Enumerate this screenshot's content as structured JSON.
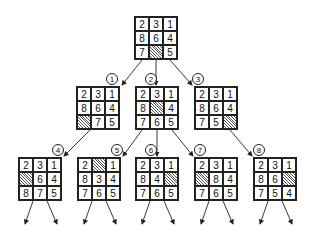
{
  "diagram": {
    "type": "8-puzzle-search-tree",
    "colors": {
      "line": "#222222",
      "blank_hatch": "#555555"
    },
    "root": {
      "tiles": [
        "2",
        "3",
        "1",
        "8",
        "6",
        "4",
        "7",
        "",
        "5"
      ]
    },
    "nodes": [
      {
        "label": "1",
        "tiles": [
          "2",
          "3",
          "1",
          "8",
          "6",
          "4",
          "",
          "7",
          "5"
        ]
      },
      {
        "label": "2",
        "tiles": [
          "2",
          "3",
          "1",
          "8",
          "",
          "4",
          "7",
          "6",
          "5"
        ]
      },
      {
        "label": "3",
        "tiles": [
          "2",
          "3",
          "1",
          "8",
          "6",
          "4",
          "7",
          "5",
          ""
        ]
      },
      {
        "label": "4",
        "tiles": [
          "2",
          "3",
          "1",
          "",
          "6",
          "4",
          "8",
          "7",
          "5"
        ]
      },
      {
        "label": "5",
        "tiles": [
          "2",
          "",
          "1",
          "8",
          "3",
          "4",
          "7",
          "6",
          "5"
        ]
      },
      {
        "label": "6",
        "tiles": [
          "2",
          "3",
          "1",
          "8",
          "4",
          "",
          "7",
          "6",
          "5"
        ]
      },
      {
        "label": "7",
        "tiles": [
          "2",
          "3",
          "1",
          "",
          "8",
          "4",
          "7",
          "6",
          "5"
        ]
      },
      {
        "label": "8",
        "tiles": [
          "2",
          "3",
          "1",
          "8",
          "6",
          "",
          "7",
          "5",
          "4"
        ]
      }
    ]
  }
}
